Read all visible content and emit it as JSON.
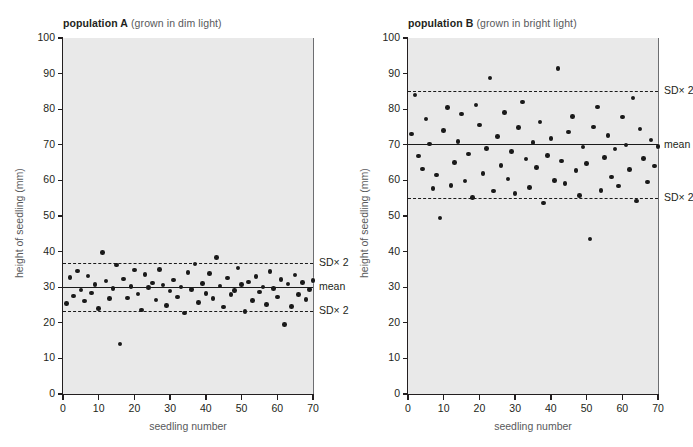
{
  "figure": {
    "background": "#ffffff",
    "plot_background": "#e9e9e9",
    "marker_color": "#1a1a1a"
  },
  "chart_data": [
    {
      "type": "scatter",
      "id": "population-a",
      "title_bold": "population A",
      "title_rest": "(grown in dim light)",
      "xlabel": "seedling number",
      "ylabel": "height of seedling (mm)",
      "xlim": [
        0,
        70
      ],
      "ylim": [
        0,
        100
      ],
      "xticks": [
        0,
        10,
        20,
        30,
        40,
        50,
        60,
        70
      ],
      "yticks": [
        0,
        10,
        20,
        30,
        40,
        50,
        60,
        70,
        80,
        90,
        100
      ],
      "grid": false,
      "mean": 30.0,
      "mean_label": "mean",
      "sd_upper": 36.8,
      "sd_lower": 23.4,
      "sd_upper_label": "SD× 2",
      "sd_lower_label": "SD× 2",
      "x": [
        1,
        2,
        3,
        4,
        5,
        6,
        7,
        8,
        9,
        10,
        11,
        12,
        13,
        14,
        15,
        16,
        17,
        18,
        19,
        20,
        21,
        22,
        23,
        24,
        25,
        26,
        27,
        28,
        29,
        30,
        31,
        32,
        33,
        34,
        35,
        36,
        37,
        38,
        39,
        40,
        41,
        42,
        43,
        44,
        45,
        46,
        47,
        48,
        49,
        50,
        51,
        52,
        53,
        54,
        55,
        56,
        57,
        58,
        59,
        60,
        61,
        62,
        63,
        64,
        65,
        66,
        67,
        68,
        69,
        70
      ],
      "values": [
        25.4,
        32.8,
        27.5,
        34.6,
        29.2,
        26.1,
        33.1,
        28.4,
        30.8,
        24.0,
        39.8,
        31.7,
        26.9,
        29.6,
        36.2,
        14.0,
        32.3,
        27.0,
        30.2,
        34.8,
        28.1,
        23.6,
        33.5,
        29.9,
        31.2,
        26.4,
        35.0,
        30.6,
        24.8,
        28.9,
        32.0,
        27.3,
        30.1,
        22.8,
        34.2,
        29.4,
        36.5,
        25.7,
        31.0,
        28.2,
        33.8,
        26.8,
        38.4,
        30.3,
        24.4,
        32.6,
        27.9,
        29.1,
        35.4,
        30.7,
        23.2,
        31.5,
        26.2,
        33.0,
        28.6,
        30.0,
        25.1,
        34.4,
        29.7,
        27.2,
        32.1,
        19.6,
        30.9,
        24.6,
        33.4,
        28.0,
        31.3,
        26.6,
        29.3,
        31.8
      ]
    },
    {
      "type": "scatter",
      "id": "population-b",
      "title_bold": "population B",
      "title_rest": "(grown in bright light)",
      "xlabel": "seedling number",
      "ylabel": "height of seedling (mm)",
      "xlim": [
        0,
        70
      ],
      "ylim": [
        0,
        100
      ],
      "xticks": [
        0,
        10,
        20,
        30,
        40,
        50,
        60,
        70
      ],
      "yticks": [
        0,
        10,
        20,
        30,
        40,
        50,
        60,
        70,
        80,
        90,
        100
      ],
      "grid": false,
      "mean": 70.0,
      "mean_label": "mean",
      "sd_upper": 85.0,
      "sd_lower": 55.0,
      "sd_upper_label": "SD× 2",
      "sd_lower_label": "SD× 2",
      "x": [
        1,
        2,
        3,
        4,
        5,
        6,
        7,
        8,
        9,
        10,
        11,
        12,
        13,
        14,
        15,
        16,
        17,
        18,
        19,
        20,
        21,
        22,
        23,
        24,
        25,
        26,
        27,
        28,
        29,
        30,
        31,
        32,
        33,
        34,
        35,
        36,
        37,
        38,
        39,
        40,
        41,
        42,
        43,
        44,
        45,
        46,
        47,
        48,
        49,
        50,
        51,
        52,
        53,
        54,
        55,
        56,
        57,
        58,
        59,
        60,
        61,
        62,
        63,
        64,
        65,
        66,
        67,
        68,
        69,
        70
      ],
      "values": [
        73.0,
        84.0,
        66.8,
        63.2,
        77.2,
        70.2,
        57.8,
        61.5,
        49.4,
        74.0,
        80.4,
        58.6,
        65.0,
        71.0,
        78.6,
        59.8,
        67.4,
        55.2,
        81.2,
        75.6,
        62.0,
        69.0,
        88.8,
        57.0,
        72.4,
        64.2,
        79.0,
        60.4,
        68.2,
        56.4,
        74.8,
        82.0,
        66.0,
        58.0,
        70.6,
        63.6,
        76.4,
        53.6,
        67.0,
        71.8,
        60.0,
        91.5,
        65.4,
        59.2,
        73.6,
        78.0,
        62.8,
        55.8,
        69.4,
        64.8,
        43.5,
        75.0,
        80.6,
        57.2,
        66.4,
        72.6,
        61.0,
        68.8,
        58.4,
        77.8,
        70.0,
        63.0,
        83.2,
        54.2,
        74.4,
        66.2,
        59.6,
        71.4,
        64.0,
        69.6
      ]
    }
  ]
}
